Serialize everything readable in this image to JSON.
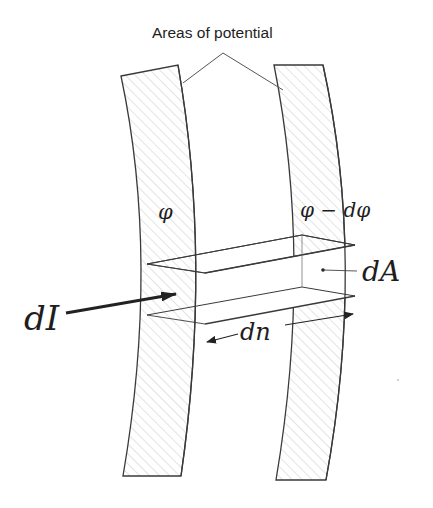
{
  "diagram": {
    "title_label": "Areas of potential",
    "labels": {
      "phi": "φ",
      "phi_minus_dphi": "φ − dφ",
      "dA": "dA",
      "dI": "dI",
      "dn": "dn"
    },
    "colors": {
      "line": "#3a3a3a",
      "hatch": "#c8c8c8",
      "text": "#1e1e1e",
      "background": "#ffffff"
    },
    "elements": [
      "left equipotential strip (hatched)",
      "right equipotential strip (hatched)",
      "current tube prism between strips",
      "current arrow dI",
      "distance arrow dn",
      "area marker dA"
    ]
  }
}
